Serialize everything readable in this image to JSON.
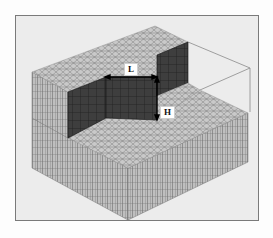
{
  "figure": {
    "labels": {
      "length": "L",
      "height": "H"
    },
    "colors": {
      "background": "#ececec",
      "frame_border": "#7a7a7a",
      "mesh_light": "#b8b8b8",
      "mesh_line": "#6a6a6a",
      "wall_dark": "#3c3c3c",
      "wall_grid": "#1a1a1a",
      "dimension_arrow": "#000000"
    }
  }
}
